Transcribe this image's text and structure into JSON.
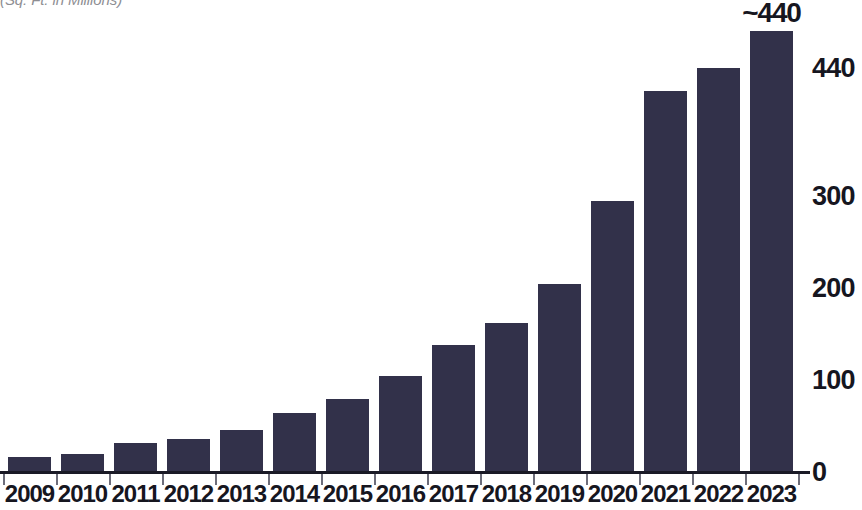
{
  "chart_data": {
    "type": "bar",
    "title": "",
    "subtitle": "(Sq. Ft. in Millions)",
    "xlabel": "",
    "ylabel": "",
    "categories": [
      "2009",
      "2010",
      "2011",
      "2012",
      "2013",
      "2014",
      "2015",
      "2016",
      "2017",
      "2018",
      "2019",
      "2020",
      "2021",
      "2022",
      "2023"
    ],
    "values": [
      16,
      20,
      32,
      36,
      46,
      64,
      80,
      105,
      138,
      162,
      205,
      295,
      415,
      440,
      480
    ],
    "ylim": [
      0,
      480
    ],
    "y_ticks": [
      0,
      100,
      200,
      300,
      440
    ],
    "y_tick_labels": [
      "0",
      "100",
      "200",
      "300",
      "440"
    ],
    "grid": false,
    "legend": null,
    "axis_position": "right",
    "bar_color": "#32314a",
    "text_color": "#16161f",
    "subtitle_color": "#8e8e93",
    "background_color": "#ffffff",
    "annotations": [
      {
        "text": "~440",
        "category": "2023",
        "position": "above-bar"
      }
    ]
  }
}
